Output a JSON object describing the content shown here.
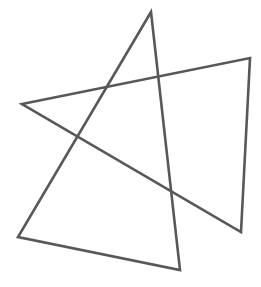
{
  "figure": {
    "width": 261,
    "height": 287,
    "background": "#ffffff",
    "stroke_color": "#585858",
    "stroke_width": 2.6,
    "shapes": [
      {
        "name": "tall-triangle",
        "points": [
          [
            151,
            12
          ],
          [
            18,
            237
          ],
          [
            180,
            270
          ]
        ]
      },
      {
        "name": "wide-triangle",
        "points": [
          [
            22,
            104
          ],
          [
            250,
            58
          ],
          [
            241,
            232
          ]
        ]
      }
    ]
  }
}
